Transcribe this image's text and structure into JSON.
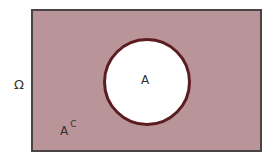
{
  "diagram": {
    "type": "venn",
    "universe_label": "Ω",
    "set_label": "A",
    "complement_label": {
      "base": "A",
      "superscript": "C"
    },
    "colors": {
      "complement_fill": "#b99499",
      "universe_border": "#4a4446",
      "set_fill": "#ffffff",
      "set_border": "#5c1d22"
    }
  }
}
